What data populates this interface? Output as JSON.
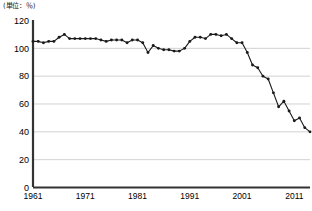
{
  "chart_data": {
    "type": "line",
    "title": "",
    "subtitle": "",
    "unit_label": "(単位：％)",
    "xlabel": "",
    "ylabel": "",
    "xlim": [
      1961,
      2014
    ],
    "ylim": [
      0,
      120
    ],
    "grid": true,
    "legend": false,
    "legend_position": "none",
    "y_ticks": [
      0,
      20,
      40,
      60,
      80,
      100,
      120
    ],
    "y_tick_labels": [
      "0",
      "20",
      "40",
      "60",
      "80",
      "100",
      "120"
    ],
    "x_ticks": [
      1961,
      1971,
      1981,
      1991,
      2001,
      2011
    ],
    "x_tick_labels": [
      "1961",
      "1971",
      "1981",
      "1991",
      "2001",
      "2011"
    ],
    "marker": "filled-circle",
    "line_color": "#1a1a1a",
    "marker_color": "#1a1a1a",
    "grid_color": "#bfbfbf",
    "axis_color": "#333333",
    "series": [
      {
        "name": "index",
        "x": [
          1961,
          1962,
          1963,
          1964,
          1965,
          1966,
          1967,
          1968,
          1969,
          1970,
          1971,
          1972,
          1973,
          1974,
          1975,
          1976,
          1977,
          1978,
          1979,
          1980,
          1981,
          1982,
          1983,
          1984,
          1985,
          1986,
          1987,
          1988,
          1989,
          1990,
          1991,
          1992,
          1993,
          1994,
          1995,
          1996,
          1997,
          1998,
          1999,
          2000,
          2001,
          2002,
          2003,
          2004,
          2005,
          2006,
          2007,
          2008,
          2009,
          2010,
          2011,
          2012,
          2013,
          2014
        ],
        "values": [
          105,
          105,
          104,
          105,
          105,
          108,
          110,
          107,
          107,
          107,
          107,
          107,
          107,
          106,
          105,
          106,
          106,
          106,
          104,
          106,
          106,
          104,
          97,
          102,
          100,
          99,
          99,
          98,
          98,
          100,
          105,
          108,
          108,
          107,
          110,
          110,
          109,
          110,
          107,
          104,
          104,
          97,
          88,
          86,
          80,
          78,
          68,
          58,
          62,
          55,
          48,
          50,
          43,
          40
        ]
      }
    ],
    "footnote": ""
  }
}
